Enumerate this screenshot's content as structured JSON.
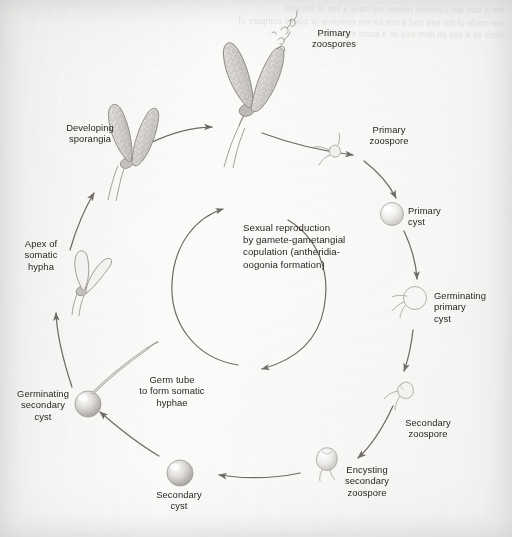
{
  "diagram": {
    "paper_color": "#fbfbfa",
    "ink_color": "#241f1d",
    "arrow_color": "#6f6a66",
    "drawing_color": "#8d8a86",
    "ghost_text": "the a sum are common reason not have a line of the sum\nare made of the sea and a sea for the complete or plants compare of\nstore as a sea an item sea on a some sea a sea",
    "center_label": "Sexual reproduction\nby gamete-gametangial\ncopulation (antheridia-\noogonia formation)",
    "labels": [
      {
        "id": "primary-zoospores",
        "text": "Primary\nzoospores",
        "x": 291,
        "y": 27,
        "w": 86,
        "align": "c"
      },
      {
        "id": "developing-sporangia",
        "text": "Developing\nsporangia",
        "x": 42,
        "y": 122,
        "w": 96,
        "align": "c"
      },
      {
        "id": "primary-zoospore",
        "text": "Primary\nzoospore",
        "x": 353,
        "y": 124,
        "w": 72,
        "align": "c"
      },
      {
        "id": "primary-cyst",
        "text": "Primary\ncyst",
        "x": 408,
        "y": 205,
        "w": 62,
        "align": "l"
      },
      {
        "id": "apex-of-somatic-hypha",
        "text": "Apex of\nsomatic\nhypha",
        "x": 8,
        "y": 238,
        "w": 66,
        "align": "c"
      },
      {
        "id": "germinating-primary-cyst",
        "text": "Germinating\nprimary\ncyst",
        "x": 434,
        "y": 290,
        "w": 76,
        "align": "l"
      },
      {
        "id": "germ-tube",
        "text": "Germ tube\nto form somatic\nhyphae",
        "x": 124,
        "y": 374,
        "w": 96,
        "align": "c"
      },
      {
        "id": "germinating-secondary-cyst",
        "text": "Germinating\nsecondary\ncyst",
        "x": 4,
        "y": 388,
        "w": 78,
        "align": "c"
      },
      {
        "id": "secondary-zoospore",
        "text": "Secondary\nzoospore",
        "x": 390,
        "y": 417,
        "w": 76,
        "align": "c"
      },
      {
        "id": "secondary-cyst",
        "text": "Secondary\ncyst",
        "x": 141,
        "y": 489,
        "w": 76,
        "align": "c"
      },
      {
        "id": "encysting-secondary-zoospore",
        "text": "Encysting\nsecondary\nzoospore",
        "x": 330,
        "y": 464,
        "w": 74,
        "align": "c"
      }
    ],
    "stages": [
      {
        "id": "sporangia-releasing",
        "kind": "sporangia-pair",
        "label": "primary-zoospores"
      },
      {
        "id": "developing-sporangia",
        "kind": "sporangia-pair",
        "label": "developing-sporangia"
      },
      {
        "id": "somatic-hypha-apex",
        "kind": "hypha-apex",
        "label": "apex-of-somatic-hypha"
      },
      {
        "id": "primary-cyst",
        "kind": "sphere",
        "label": "primary-cyst"
      },
      {
        "id": "germinating-primary",
        "kind": "sphere-germ",
        "label": "germinating-primary-cyst"
      },
      {
        "id": "secondary-zoospore",
        "kind": "biflagellate",
        "label": "secondary-zoospore"
      },
      {
        "id": "encysting-zoospore",
        "kind": "encysting",
        "label": "encysting-secondary-zoospore"
      },
      {
        "id": "secondary-cyst",
        "kind": "sphere",
        "label": "secondary-cyst"
      },
      {
        "id": "germinating-secondary",
        "kind": "sphere-germtube",
        "label": "germinating-secondary-cyst"
      }
    ]
  }
}
